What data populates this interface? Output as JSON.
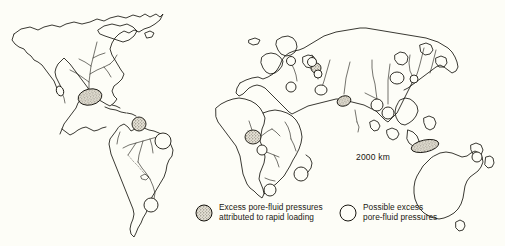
{
  "figure": {
    "type": "world-map",
    "title": "",
    "background_color": "#fdfdf7",
    "line_color": "#17150f",
    "scale_annotation": "2000 km"
  },
  "legend": {
    "items": [
      {
        "symbol": "stippled-circle",
        "symbol_name": "filled-circle-icon",
        "fill_color": "#cfcabc",
        "line_1": "Excess pore-fluid pressures",
        "line_2": "attributed to rapid loading"
      },
      {
        "symbol": "open-circle",
        "symbol_name": "open-circle-icon",
        "fill_color": "#fdfdf7",
        "line_1": "Possible excess",
        "line_2": "pore-fluid pressures"
      }
    ]
  },
  "markers": {
    "filled": [
      {
        "name": "mississippi-delta",
        "cx": 90,
        "cy": 97,
        "rx": 12,
        "ry": 8,
        "rot": -12
      },
      {
        "name": "magdalena-caribbean",
        "cx": 139,
        "cy": 124,
        "rx": 7,
        "ry": 7,
        "rot": 0
      },
      {
        "name": "niger-delta",
        "cx": 253,
        "cy": 137,
        "rx": 8,
        "ry": 7,
        "rot": 0
      },
      {
        "name": "caspian-volga",
        "cx": 316,
        "cy": 68,
        "rx": 5,
        "ry": 5,
        "rot": 0
      },
      {
        "name": "indus-arabian-sea",
        "cx": 344,
        "cy": 101,
        "rx": 7,
        "ry": 5,
        "rot": -18
      },
      {
        "name": "papua-gulf",
        "cx": 425,
        "cy": 146,
        "rx": 14,
        "ry": 6,
        "rot": -12
      }
    ],
    "open": [
      {
        "name": "gulf-of-california",
        "cx": 60,
        "cy": 91,
        "rx": 3.5,
        "ry": 5,
        "rot": -20
      },
      {
        "name": "amazon-mouth",
        "cx": 163,
        "cy": 141,
        "rx": 8,
        "ry": 8,
        "rot": 0
      },
      {
        "name": "rio-de-la-plata",
        "cx": 151,
        "cy": 205,
        "rx": 7,
        "ry": 7,
        "rot": 0
      },
      {
        "name": "congo-mouth",
        "cx": 262,
        "cy": 150,
        "rx": 5,
        "ry": 5,
        "rot": 0
      },
      {
        "name": "zambezi-mouth",
        "cx": 301,
        "cy": 174,
        "rx": 7,
        "ry": 7,
        "rot": 0
      },
      {
        "name": "orange-river",
        "cx": 270,
        "cy": 190,
        "rx": 6,
        "ry": 6,
        "rot": 0
      },
      {
        "name": "rhone-delta",
        "cx": 291,
        "cy": 87,
        "rx": 5,
        "ry": 5,
        "rot": 0
      },
      {
        "name": "po-delta",
        "cx": 291,
        "cy": 61,
        "rx": 4.5,
        "ry": 4.5,
        "rot": 0
      },
      {
        "name": "volga-north",
        "cx": 312,
        "cy": 62,
        "rx": 4.5,
        "ry": 4.5,
        "rot": 0
      },
      {
        "name": "caspian-south",
        "cx": 318,
        "cy": 74,
        "rx": 4,
        "ry": 4,
        "rot": 0
      },
      {
        "name": "tigris-euphrates",
        "cx": 321,
        "cy": 90,
        "rx": 6,
        "ry": 5,
        "rot": 0
      },
      {
        "name": "ganges-brahmaputra",
        "cx": 377,
        "cy": 105,
        "rx": 6,
        "ry": 6,
        "rot": 0
      },
      {
        "name": "irrawaddy",
        "cx": 388,
        "cy": 113,
        "rx": 6,
        "ry": 6,
        "rot": 0
      },
      {
        "name": "mekong",
        "cx": 397,
        "cy": 78,
        "rx": 7,
        "ry": 6,
        "rot": 0
      },
      {
        "name": "huanghe",
        "cx": 414,
        "cy": 79,
        "rx": 4,
        "ry": 4,
        "rot": 0
      },
      {
        "name": "north-island-nz",
        "cx": 477,
        "cy": 157,
        "rx": 5,
        "ry": 5,
        "rot": 0
      }
    ]
  }
}
